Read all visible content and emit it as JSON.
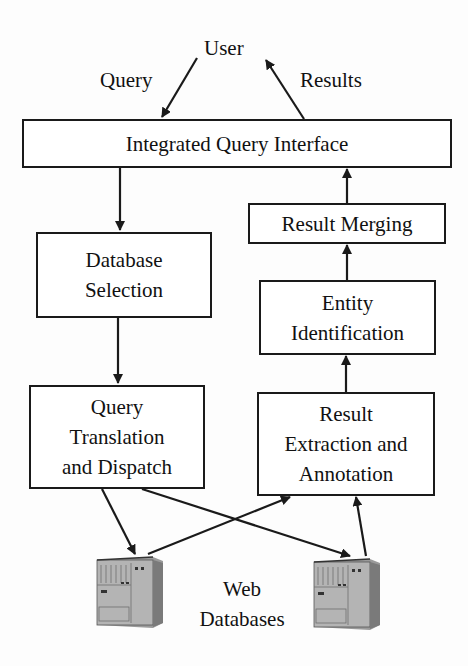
{
  "diagram": {
    "nodes": {
      "user": "User",
      "interface": "Integrated Query Interface",
      "db_selection": [
        "Database",
        "Selection"
      ],
      "query_translation": [
        "Query",
        "Translation",
        "and Dispatch"
      ],
      "result_merging": "Result Merging",
      "entity_identification": [
        "Entity",
        "Identification"
      ],
      "result_extraction": [
        "Result",
        "Extraction and",
        "Annotation"
      ],
      "web_databases": [
        "Web",
        "Databases"
      ]
    },
    "edge_labels": {
      "query": "Query",
      "results": "Results"
    },
    "edges": [
      {
        "from": "user",
        "to": "interface",
        "label": "Query"
      },
      {
        "from": "interface",
        "to": "user",
        "label": "Results"
      },
      {
        "from": "interface",
        "to": "db_selection"
      },
      {
        "from": "db_selection",
        "to": "query_translation"
      },
      {
        "from": "query_translation",
        "to": "web_database_1"
      },
      {
        "from": "query_translation",
        "to": "web_database_2"
      },
      {
        "from": "web_database_1",
        "to": "result_extraction"
      },
      {
        "from": "web_database_2",
        "to": "result_extraction"
      },
      {
        "from": "result_extraction",
        "to": "entity_identification"
      },
      {
        "from": "entity_identification",
        "to": "result_merging"
      },
      {
        "from": "result_merging",
        "to": "interface"
      }
    ],
    "colors": {
      "line": "#1a1a1a",
      "server_body": "#a8a8a8",
      "server_dark": "#6e6e6e",
      "background": "#fdfdfd"
    }
  }
}
